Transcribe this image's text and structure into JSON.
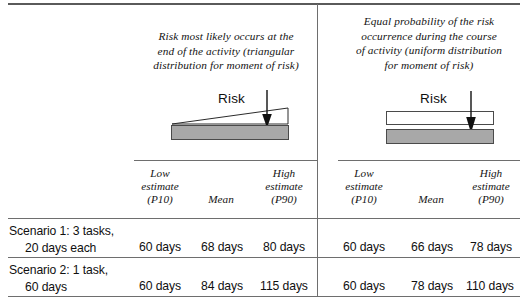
{
  "figure": {
    "panels": [
      {
        "id": "triangular",
        "caption": "Risk most likely occurs at the end of the activity (triangular distribution for moment of risk)",
        "caption_lines": [
          "Risk most likely occurs at the",
          "end of the activity (triangular",
          "distribution for moment of risk)"
        ],
        "diagram": {
          "risk_label": "Risk",
          "shape": "triangle-over-bar",
          "arrow": "down-arrow",
          "bar_color": "#a8a8a8"
        },
        "columns": [
          {
            "line1": "Low",
            "line2": "estimate",
            "line3": "(P10)"
          },
          {
            "line1": "",
            "line2": "Mean",
            "line3": ""
          },
          {
            "line1": "High",
            "line2": "estimate",
            "line3": "(P90)"
          }
        ],
        "values": [
          [
            "60 days",
            "68 days",
            "80 days"
          ],
          [
            "60 days",
            "84 days",
            "115 days"
          ]
        ]
      },
      {
        "id": "uniform",
        "caption": "Equal probability of the risk occurrence during the course of activity (uniform distribution for moment of risk)",
        "caption_lines": [
          "Equal probability of the risk",
          "occurrence during the course",
          "of activity (uniform distribution",
          "for moment of risk)"
        ],
        "diagram": {
          "risk_label": "Risk",
          "shape": "rectangle-over-bar",
          "arrow": "down-arrow",
          "bar_color": "#a8a8a8"
        },
        "columns": [
          {
            "line1": "Low",
            "line2": "estimate",
            "line3": "(P10)"
          },
          {
            "line1": "",
            "line2": "Mean",
            "line3": ""
          },
          {
            "line1": "High",
            "line2": "estimate",
            "line3": "(P90)"
          }
        ],
        "values": [
          [
            "60 days",
            "66 days",
            "78 days"
          ],
          [
            "60 days",
            "78 days",
            "110 days"
          ]
        ]
      }
    ],
    "rows": [
      {
        "line1": "Scenario 1: 3 tasks,",
        "line2": "20 days each"
      },
      {
        "line1": "Scenario 2: 1 task,",
        "line2": "60 days"
      }
    ]
  }
}
